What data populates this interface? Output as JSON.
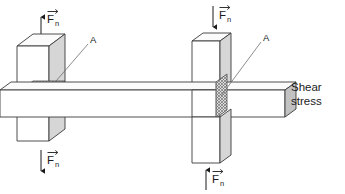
{
  "figure": {
    "background_color": "#ffffff",
    "line_color": "#3a3a3a",
    "shade_color": "#d6d6d6",
    "text_color": "#1a1a1a"
  },
  "panels": {
    "left": {
      "caption_line1": "Normal",
      "caption_line2": "stress",
      "area_label": "A",
      "force_symbol": "F",
      "force_subscript": "n",
      "top_force_label": "F",
      "top_force_sub": "n",
      "bottom_force_label": "F",
      "bottom_force_sub": "n",
      "top_arrow_direction": "up",
      "bottom_arrow_direction": "down",
      "cross_section_orientation": "horizontal"
    },
    "right": {
      "caption_line1": "Shear",
      "caption_line2": "stress",
      "area_label": "A",
      "force_symbol": "F",
      "force_subscript": "n",
      "top_force_label": "F",
      "top_force_sub": "n",
      "bottom_force_label": "F",
      "bottom_force_sub": "n",
      "top_arrow_direction": "down",
      "bottom_arrow_direction": "up",
      "cross_section_orientation": "vertical"
    }
  }
}
